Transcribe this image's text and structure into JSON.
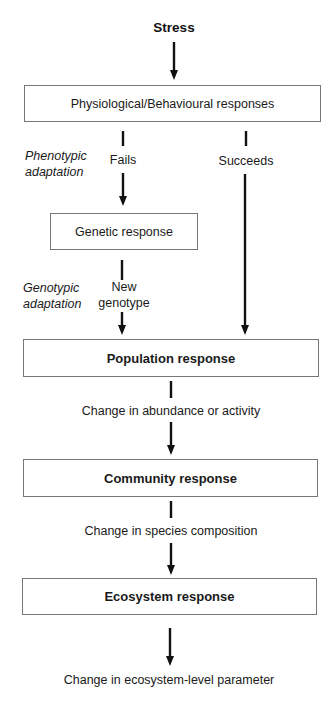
{
  "diagram": {
    "title": "Stress",
    "boxes": {
      "physiological": "Physiological/Behavioural responses",
      "genetic": "Genetic response",
      "population": "Population response",
      "community": "Community response",
      "ecosystem": "Ecosystem response"
    },
    "edge_labels": {
      "fails": "Fails",
      "succeeds": "Succeeds",
      "new_genotype_line1": "New",
      "new_genotype_line2": "genotype",
      "abundance": "Change in abundance or activity",
      "species": "Change in species composition",
      "ecosystem_param": "Change in ecosystem-level parameter"
    },
    "side_labels": {
      "phenotypic_line1": "Phenotypic",
      "phenotypic_line2": "adaptation",
      "genotypic_line1": "Genotypic",
      "genotypic_line2": "adaptation"
    },
    "colors": {
      "line": "#111111",
      "box_border": "#777777",
      "background": "#ffffff"
    }
  }
}
